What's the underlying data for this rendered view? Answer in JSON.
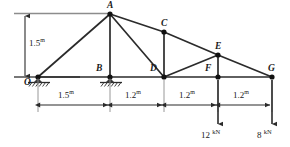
{
  "figure": {
    "type": "truss-free-body-diagram",
    "stroke_color": "#2b2b2b",
    "node_color": "#111111",
    "background": "#ffffff"
  },
  "geometry": {
    "units": "m",
    "nodes": [
      {
        "id": "O",
        "label": "O",
        "x": 38,
        "y": 77,
        "label_x": 25,
        "label_y": 78
      },
      {
        "id": "A",
        "label": "A",
        "x": 110,
        "y": 14,
        "label_x": 107,
        "label_y": 2
      },
      {
        "id": "B",
        "label": "B",
        "x": 110,
        "y": 77,
        "label_x": 97,
        "label_y": 65
      },
      {
        "id": "C",
        "label": "C",
        "x": 164,
        "y": 32,
        "label_x": 161,
        "label_y": 20
      },
      {
        "id": "D",
        "label": "D",
        "x": 164,
        "y": 77,
        "label_x": 151,
        "label_y": 65
      },
      {
        "id": "E",
        "label": "E",
        "x": 218,
        "y": 55,
        "label_x": 215,
        "label_y": 43
      },
      {
        "id": "F",
        "label": "F",
        "x": 218,
        "y": 77,
        "label_x": 206,
        "label_y": 65
      },
      {
        "id": "G",
        "label": "G",
        "x": 272,
        "y": 77,
        "label_x": 269,
        "label_y": 65
      }
    ],
    "members": [
      {
        "from": "O",
        "to": "A"
      },
      {
        "from": "O",
        "to": "B"
      },
      {
        "from": "A",
        "to": "B"
      },
      {
        "from": "A",
        "to": "C"
      },
      {
        "from": "A",
        "to": "D"
      },
      {
        "from": "B",
        "to": "D"
      },
      {
        "from": "C",
        "to": "D"
      },
      {
        "from": "C",
        "to": "E"
      },
      {
        "from": "D",
        "to": "E"
      },
      {
        "from": "D",
        "to": "F"
      },
      {
        "from": "E",
        "to": "F"
      },
      {
        "from": "E",
        "to": "G"
      },
      {
        "from": "F",
        "to": "G"
      }
    ]
  },
  "supports": [
    {
      "at": "O",
      "kind": "pin-on-ground",
      "x": 38,
      "y": 77
    },
    {
      "at": "B",
      "kind": "pin-on-ground",
      "x": 110,
      "y": 77
    }
  ],
  "ground_line": {
    "x1": 14,
    "x2": 80,
    "y": 77
  },
  "dimensions": {
    "vertical": {
      "value": "1.5",
      "unit": "m",
      "text": "1.5",
      "x": 25,
      "y_top": 14,
      "y_bottom": 77,
      "label_x": 29,
      "label_y": 41
    },
    "horizontal_line_y": 105,
    "horizontal": [
      {
        "value": "1.5",
        "unit": "m",
        "x1": 38,
        "x2": 110,
        "label_x": 62,
        "label_y": 91
      },
      {
        "value": "1.2",
        "unit": "m",
        "x1": 110,
        "x2": 164,
        "label_x": 128,
        "label_y": 91
      },
      {
        "value": "1.2",
        "unit": "m",
        "x1": 164,
        "x2": 218,
        "label_x": 182,
        "label_y": 91
      },
      {
        "value": "1.2",
        "unit": "m",
        "x1": 218,
        "x2": 272,
        "label_x": 236,
        "label_y": 91
      }
    ],
    "extension_lines": [
      {
        "x": 38,
        "y1": 79,
        "y2": 112
      },
      {
        "x": 110,
        "y1": 79,
        "y2": 112
      },
      {
        "x": 164,
        "y1": 79,
        "y2": 112
      },
      {
        "x": 218,
        "y1": 79,
        "y2": 112
      },
      {
        "x": 272,
        "y1": 79,
        "y2": 112
      }
    ]
  },
  "loads": [
    {
      "at": "F",
      "magnitude": "12",
      "unit": "kN",
      "x": 218,
      "y_top": 79,
      "y_bottom": 125,
      "label_x": 203,
      "label_y": 130
    },
    {
      "at": "G",
      "magnitude": "8",
      "unit": "kN",
      "x": 272,
      "y_top": 79,
      "y_bottom": 125,
      "label_x": 260,
      "label_y": 130
    }
  ]
}
